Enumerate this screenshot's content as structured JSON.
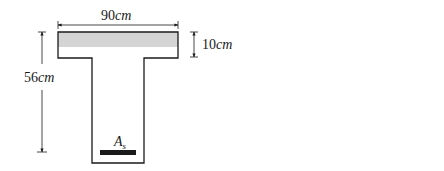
{
  "section": {
    "flange_width_label": "90",
    "flange_width_unit": "cm",
    "flange_depth_label": "10",
    "flange_depth_unit": "cm",
    "total_depth_label": "56",
    "total_depth_unit": "cm",
    "web_width_label": "45",
    "web_width_unit": "cm",
    "steel_label": "A",
    "steel_subscript": "s",
    "compression_fill": "#d4d4d4"
  },
  "strain": {
    "top_strain_label": "0.003",
    "depth_label": "x",
    "bottom_strain_symbol": "ε",
    "bottom_strain_subscript": "t"
  },
  "forces": {
    "compression_label": "C",
    "compression_subscript": "c",
    "arm_d": "d",
    "arm_minus": "−",
    "arm_num": "a",
    "arm_den": "2",
    "tension_label": "T"
  },
  "colors": {
    "line": "#1a1a1a",
    "background": "#ffffff"
  }
}
